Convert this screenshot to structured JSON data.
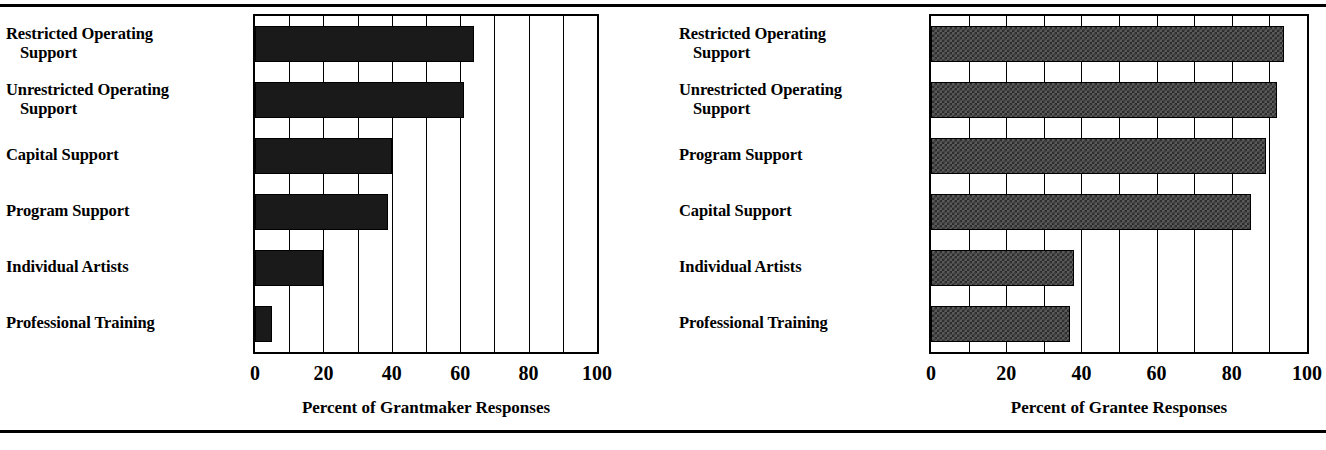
{
  "figure": {
    "top_rule": "horizontal-rule",
    "bottom_rule": "horizontal-rule"
  },
  "chart_data": [
    {
      "type": "bar",
      "orientation": "horizontal",
      "panel": "left",
      "title": "",
      "xlabel": "Percent of Grantmaker Responses",
      "ylabel": "",
      "xlim": [
        0,
        100
      ],
      "xticks": [
        0,
        20,
        40,
        60,
        80,
        100
      ],
      "xtick_labels": [
        "0",
        "20",
        "40",
        "60",
        "80",
        "100"
      ],
      "gridlines_every": 10,
      "grid": true,
      "legend": "none",
      "bar_style": "solid-black",
      "categories": [
        "Restricted Operating Support",
        "Unrestricted Operating Support",
        "Capital Support",
        "Program Support",
        "Individual Artists",
        "Professional Training"
      ],
      "category_lines": [
        [
          "Restricted Operating",
          "Support"
        ],
        [
          "Unrestricted Operating",
          "Support"
        ],
        [
          "Capital Support",
          ""
        ],
        [
          "Program Support",
          ""
        ],
        [
          "Individual Artists",
          ""
        ],
        [
          "Professional Training",
          ""
        ]
      ],
      "values": [
        64,
        61,
        40,
        39,
        20,
        5
      ]
    },
    {
      "type": "bar",
      "orientation": "horizontal",
      "panel": "right",
      "title": "",
      "xlabel": "Percent of Grantee Responses",
      "ylabel": "",
      "xlim": [
        0,
        100
      ],
      "xticks": [
        0,
        20,
        40,
        60,
        80,
        100
      ],
      "xtick_labels": [
        "0",
        "20",
        "40",
        "60",
        "80",
        "100"
      ],
      "gridlines_every": 10,
      "grid": true,
      "legend": "none",
      "bar_style": "checkered-gray",
      "categories": [
        "Restricted Operating Support",
        "Unrestricted Operating Support",
        "Program Support",
        "Capital Support",
        "Individual Artists",
        "Professional Training"
      ],
      "category_lines": [
        [
          "Restricted Operating",
          "Support"
        ],
        [
          "Unrestricted Operating",
          "Support"
        ],
        [
          "Program Support",
          ""
        ],
        [
          "Capital Support",
          ""
        ],
        [
          "Individual Artists",
          ""
        ],
        [
          "Professional Training",
          ""
        ]
      ],
      "values": [
        94,
        92,
        89,
        85,
        38,
        37
      ]
    }
  ],
  "colors": {
    "ink": "#000000",
    "paper": "#ffffff",
    "bar_solid": "#1a1a1a",
    "bar_hatch_light": "#5a5a5a",
    "bar_hatch_dark": "#2b2b2b"
  }
}
